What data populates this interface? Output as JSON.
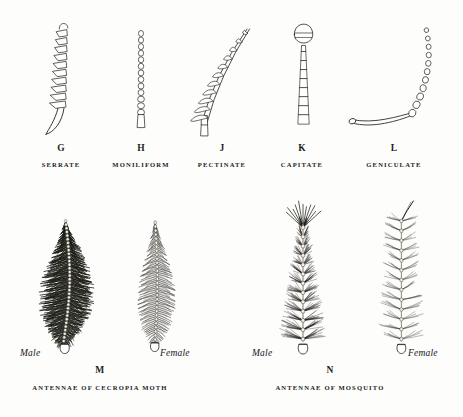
{
  "plate": {
    "background_color": "#fdfdfc",
    "ink_color": "#1d1d1d",
    "top_row": [
      {
        "letter": "G",
        "caption": "SERRATE",
        "icon": "serrate-antenna-icon",
        "x": 18,
        "y": 18,
        "w": 86,
        "h": 122
      },
      {
        "letter": "H",
        "caption": "MONILIFORM",
        "icon": "moniliform-antenna-icon",
        "x": 102,
        "y": 18,
        "w": 78,
        "h": 122
      },
      {
        "letter": "J",
        "caption": "PECTINATE",
        "icon": "pectinate-antenna-icon",
        "x": 178,
        "y": 18,
        "w": 88,
        "h": 122
      },
      {
        "letter": "K",
        "caption": "CAPITATE",
        "icon": "capitate-antenna-icon",
        "x": 264,
        "y": 18,
        "w": 76,
        "h": 122
      },
      {
        "letter": "L",
        "caption": "GENICULATE",
        "icon": "geniculate-antenna-icon",
        "x": 340,
        "y": 18,
        "w": 108,
        "h": 122
      }
    ],
    "bottom_groups": [
      {
        "letter": "M",
        "caption": "ANTENNAE OF CECROPIA MOTH",
        "letter_x": 100,
        "letter_y": 366,
        "caption_x": 100,
        "caption_y": 385,
        "specimens": [
          {
            "sex": "Male",
            "icon": "male-cecropia-antenna-icon",
            "x": 20,
            "y": 212,
            "w": 84,
            "h": 150,
            "label_x": 20,
            "label_y": 348,
            "label_align": "left"
          },
          {
            "sex": "Female",
            "icon": "female-cecropia-antenna-icon",
            "x": 112,
            "y": 212,
            "w": 80,
            "h": 150,
            "label_x": 160,
            "label_y": 348,
            "label_align": "left"
          }
        ]
      },
      {
        "letter": "N",
        "caption": "ANTENNAE OF MOSQUITO",
        "letter_x": 330,
        "letter_y": 366,
        "caption_x": 330,
        "caption_y": 385,
        "specimens": [
          {
            "sex": "Male",
            "icon": "male-mosquito-antenna-icon",
            "x": 248,
            "y": 198,
            "w": 110,
            "h": 164,
            "label_x": 252,
            "label_y": 348,
            "label_align": "left"
          },
          {
            "sex": "Female",
            "icon": "female-mosquito-antenna-icon",
            "x": 360,
            "y": 198,
            "w": 90,
            "h": 164,
            "label_x": 408,
            "label_y": 348,
            "label_align": "left"
          }
        ]
      }
    ]
  }
}
